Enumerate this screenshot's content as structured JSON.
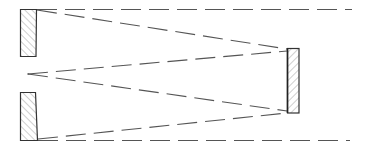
{
  "diagram": {
    "title": "",
    "colors": {
      "stroke": "#333333",
      "dash": "#555555",
      "hatch": "#777777",
      "background": "#ffffff"
    },
    "elements": {
      "mirror_top_left": {
        "label": ""
      },
      "mirror_bottom_left": {
        "label": ""
      },
      "mirror_right": {
        "label": ""
      },
      "focal_point": {
        "label": ""
      }
    }
  }
}
